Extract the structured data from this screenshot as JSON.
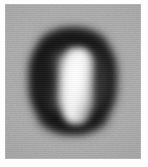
{
  "image": {
    "kind": "grayscale-raster-thumbnail",
    "width_px": 148,
    "height_px": 167,
    "alt_text": "Blurry low-resolution grayscale image of a dark rounded oval blob with a bright white vertical stripe in its center, on a noisy gray background",
    "caption": ""
  },
  "canvas": {
    "page_background_hex": "#fdfdfd",
    "margin_left_px": 5,
    "margin_top_px": 4
  },
  "panel": {
    "name": "scan-panel",
    "background_hex": "#a2a2a2",
    "left_px": 5,
    "top_px": 4,
    "width_px": 136,
    "height_px": 155,
    "texture": "film-grain-noise",
    "noise_opacity": 0.3
  },
  "blob": {
    "name": "dark-oval-blob",
    "shape": "rounded-vertical-oval",
    "darkest_hex": "#141414",
    "left_px": 29,
    "top_px": 28,
    "width_px": 88,
    "height_px": 106,
    "blur_px": 4.5
  },
  "core": {
    "name": "bright-vertical-stripe",
    "brightest_hex": "#ffffff",
    "left_px": 61,
    "top_px": 48,
    "width_px": 32,
    "height_px": 76,
    "blur_px": 3.6
  },
  "tones": {
    "background_gray_hex": "#a2a2a2",
    "ring_dark_hex": "#141414",
    "right_limb_hex": "#2a2a2a",
    "core_light_hex": "#f2f2f2",
    "halo_mid_hex": "#5f5f5f"
  }
}
